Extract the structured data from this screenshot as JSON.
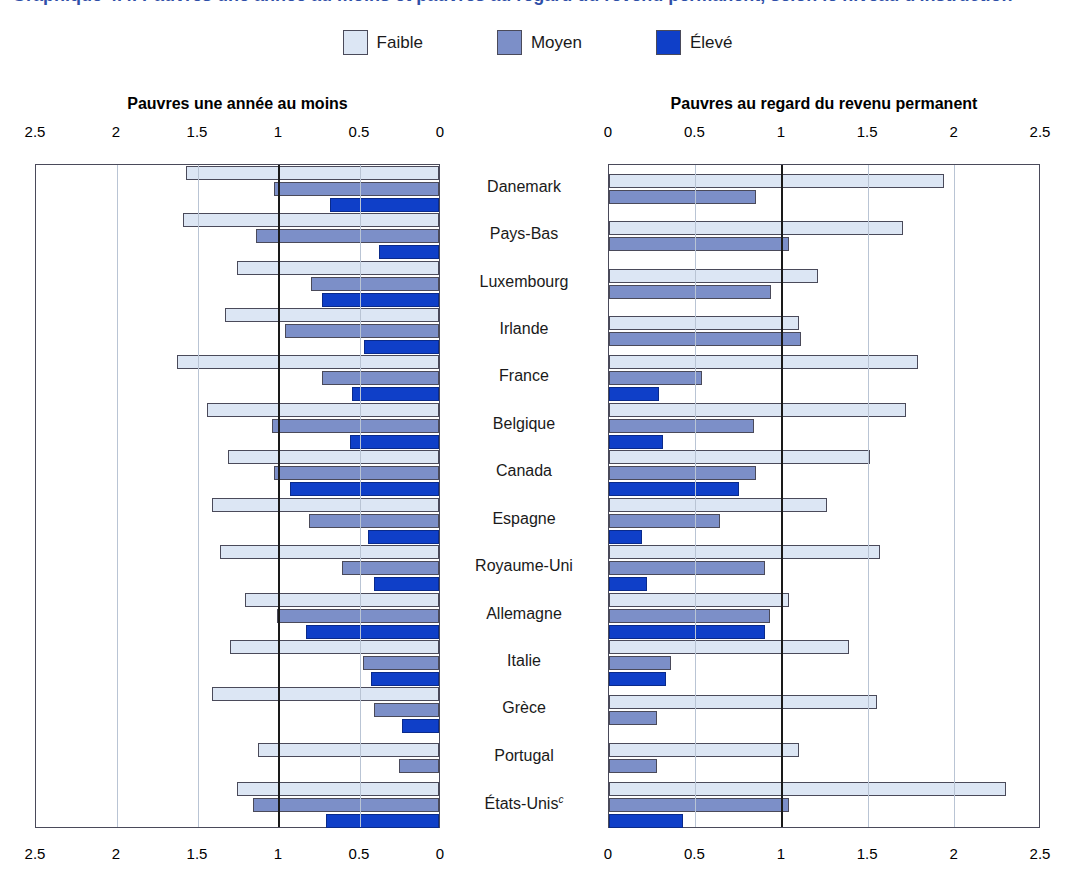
{
  "title": {
    "text": "Graphique 4.4. Pauvres une année au moins et pauvres au regard du revenu permanent, selon le niveau d'instruction",
    "color": "#2f4fa8"
  },
  "legend": {
    "items": [
      {
        "label": "Faible",
        "color": "#dce6f4",
        "name": "legend-faible"
      },
      {
        "label": "Moyen",
        "color": "#7c8fc8",
        "name": "legend-moyen"
      },
      {
        "label": "Élevé",
        "color": "#0f3fc8",
        "name": "legend-eleve"
      }
    ]
  },
  "panels": {
    "left": {
      "title": "Pauvres une année au moins",
      "ticks": [
        "2.5",
        "2",
        "1.5",
        "1",
        "0.5",
        "0"
      ],
      "direction": "right-to-left",
      "axis_min": 0,
      "axis_max": 2.5
    },
    "right": {
      "title": "Pauvres au regard du revenu permanent",
      "ticks": [
        "0",
        "0.5",
        "1",
        "1.5",
        "2",
        "2.5"
      ],
      "direction": "left-to-right",
      "axis_min": 0,
      "axis_max": 2.5
    }
  },
  "countries": [
    {
      "label": "Danemark",
      "footnote": ""
    },
    {
      "label": "Pays-Bas",
      "footnote": ""
    },
    {
      "label": "Luxembourg",
      "footnote": ""
    },
    {
      "label": "Irlande",
      "footnote": ""
    },
    {
      "label": "France",
      "footnote": ""
    },
    {
      "label": "Belgique",
      "footnote": ""
    },
    {
      "label": "Canada",
      "footnote": ""
    },
    {
      "label": "Espagne",
      "footnote": ""
    },
    {
      "label": "Royaume-Uni",
      "footnote": ""
    },
    {
      "label": "Allemagne",
      "footnote": ""
    },
    {
      "label": "Italie",
      "footnote": ""
    },
    {
      "label": "Grèce",
      "footnote": ""
    },
    {
      "label": "Portugal",
      "footnote": ""
    },
    {
      "label": "États-Unis",
      "footnote": "c"
    }
  ],
  "chart_data": {
    "type": "bar",
    "orientation": "horizontal",
    "layout": "back-to-back two-panel bar chart, shared category axis in centre",
    "title": "Pauvres une année au moins et pauvres au regard du revenu permanent, selon le niveau d'instruction",
    "categories": [
      "Danemark",
      "Pays-Bas",
      "Luxembourg",
      "Irlande",
      "France",
      "Belgique",
      "Canada",
      "Espagne",
      "Royaume-Uni",
      "Allemagne",
      "Italie",
      "Grèce",
      "Portugal",
      "États-Unis"
    ],
    "legend_entries": [
      "Faible",
      "Moyen",
      "Élevé"
    ],
    "legend_position": "top-center",
    "grid": true,
    "reference_line": 1.0,
    "panels": [
      {
        "name": "Pauvres une année au moins",
        "xlabel": "",
        "ylabel": "",
        "xlim": [
          0,
          2.5
        ],
        "xticks": [
          0,
          0.5,
          1,
          1.5,
          2,
          2.5
        ],
        "direction": "right-to-left",
        "series": [
          {
            "name": "Faible",
            "values": [
              1.56,
              1.58,
              1.25,
              1.32,
              1.62,
              1.43,
              1.3,
              1.4,
              1.35,
              1.2,
              1.29,
              1.4,
              1.12,
              1.25
            ]
          },
          {
            "name": "Moyen",
            "values": [
              1.02,
              1.13,
              0.79,
              0.95,
              0.72,
              1.03,
              1.02,
              0.8,
              0.6,
              1.0,
              0.47,
              0.4,
              0.25,
              1.15
            ]
          },
          {
            "name": "Élevé",
            "values": [
              0.67,
              0.37,
              0.72,
              0.46,
              0.54,
              0.55,
              0.92,
              0.44,
              0.4,
              0.82,
              0.42,
              0.23,
              null,
              0.7
            ]
          }
        ]
      },
      {
        "name": "Pauvres au regard du revenu permanent",
        "xlabel": "",
        "ylabel": "",
        "xlim": [
          0,
          2.5
        ],
        "xticks": [
          0,
          0.5,
          1,
          1.5,
          2,
          2.5
        ],
        "direction": "left-to-right",
        "series": [
          {
            "name": "Faible",
            "values": [
              1.94,
              1.7,
              1.21,
              1.1,
              1.79,
              1.72,
              1.51,
              1.26,
              1.57,
              1.04,
              1.39,
              1.55,
              1.1,
              2.3
            ]
          },
          {
            "name": "Moyen",
            "values": [
              0.85,
              1.04,
              0.94,
              1.11,
              0.54,
              0.84,
              0.85,
              0.64,
              0.9,
              0.93,
              0.36,
              0.28,
              0.28,
              1.04
            ]
          },
          {
            "name": "Élevé",
            "values": [
              null,
              null,
              null,
              null,
              0.29,
              0.31,
              0.75,
              0.19,
              0.22,
              0.9,
              0.33,
              null,
              null,
              0.43
            ]
          }
        ]
      }
    ]
  },
  "colors": {
    "faible": "#dce6f4",
    "moyen": "#7c8fc8",
    "eleve": "#0f3fc8",
    "gridline": "#b9c4d4",
    "reference_line": "#1a1a1a",
    "frame": "#4a4a5a"
  }
}
